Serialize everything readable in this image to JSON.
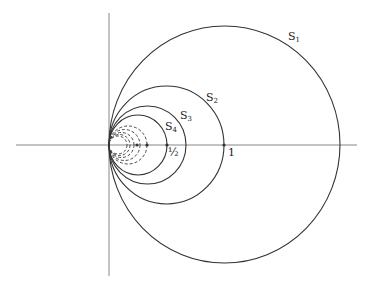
{
  "diagram": {
    "type": "tangent circles at origin",
    "colors": {
      "stroke": "#333333",
      "axis": "#888888",
      "background": "#ffffff"
    },
    "axes": {
      "origin": [
        109,
        145
      ],
      "horizontal": {
        "x1": 16,
        "x2": 357,
        "y": 145
      },
      "vertical": {
        "x": 109,
        "y1": 13,
        "y2": 276
      }
    },
    "circles": [
      {
        "id": "S1",
        "label": "S",
        "sub": "1",
        "cx": 224.5,
        "cy": 144.5,
        "rx": 115.5,
        "ry": 118.5,
        "dashed": false,
        "label_pos": [
          288,
          31
        ]
      },
      {
        "id": "S2",
        "label": "S",
        "sub": "2",
        "cx": 166.5,
        "cy": 145,
        "rx": 57.5,
        "ry": 59,
        "dashed": false,
        "label_pos": [
          206,
          92
        ]
      },
      {
        "id": "S3",
        "label": "S",
        "sub": "3",
        "cx": 147.5,
        "cy": 145,
        "rx": 38.5,
        "ry": 39,
        "dashed": false,
        "label_pos": [
          180,
          110
        ]
      },
      {
        "id": "S4",
        "label": "S",
        "sub": "4",
        "cx": 138,
        "cy": 145,
        "rx": 29,
        "ry": 30,
        "dashed": false,
        "label_pos": [
          165,
          121
        ]
      }
    ],
    "dashed_circles": [
      {
        "cx": 128,
        "cy": 145,
        "r": 19
      },
      {
        "cx": 124.5,
        "cy": 145,
        "r": 15.5
      },
      {
        "cx": 121.5,
        "cy": 145,
        "r": 12.5
      },
      {
        "cx": 119.5,
        "cy": 145,
        "r": 10.5
      },
      {
        "cx": 118,
        "cy": 145,
        "r": 9
      }
    ],
    "points": [
      {
        "x": 224,
        "y": 145
      },
      {
        "x": 167,
        "y": 145
      },
      {
        "x": 137,
        "y": 145
      },
      {
        "x": 147,
        "y": 145
      }
    ],
    "tick_labels": [
      {
        "text": "½",
        "x": 168,
        "y": 147
      },
      {
        "text": "1",
        "x": 228,
        "y": 147
      }
    ]
  }
}
